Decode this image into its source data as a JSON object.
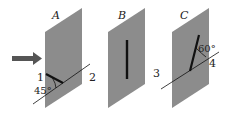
{
  "figure": {
    "panels": [
      {
        "id": "A",
        "label": "A",
        "line_labels": [
          "1",
          "2"
        ],
        "angle_label": "45°"
      },
      {
        "id": "B",
        "label": "B"
      },
      {
        "id": "C",
        "label": "C",
        "line_labels": [
          "3",
          "4"
        ],
        "angle_label": "60°"
      }
    ],
    "colors": {
      "panel": "#8c8c8c",
      "arrow": "#555555",
      "line": "#111111"
    }
  }
}
